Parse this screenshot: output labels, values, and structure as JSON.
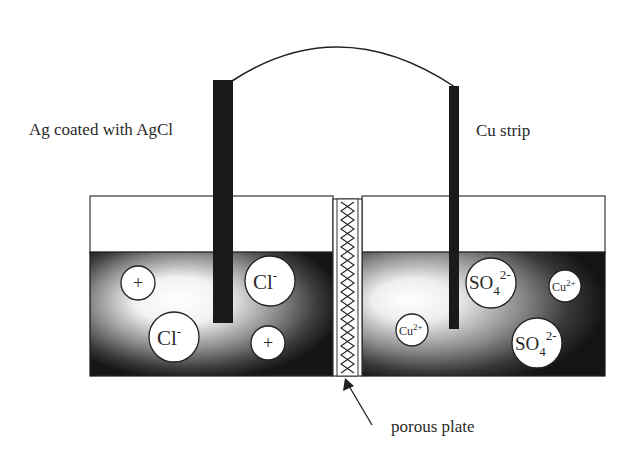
{
  "diagram": {
    "type": "electrochemical-cell",
    "labels": {
      "left_electrode": "Ag coated with AgCl",
      "right_electrode": "Cu strip",
      "separator": "porous plate"
    },
    "left_half_cell": {
      "electrode": "Ag/AgCl",
      "ions": [
        {
          "id": "plus-1",
          "symbol": "+",
          "sup": "",
          "sub": ""
        },
        {
          "id": "cl-1",
          "symbol": "Cl",
          "sup": "-",
          "sub": ""
        },
        {
          "id": "cl-2",
          "symbol": "Cl",
          "sup": "-",
          "sub": ""
        },
        {
          "id": "plus-2",
          "symbol": "+",
          "sup": "",
          "sub": ""
        }
      ]
    },
    "right_half_cell": {
      "electrode": "Cu",
      "ions": [
        {
          "id": "so4-1",
          "symbol": "SO",
          "sub": "4",
          "sup": "2-"
        },
        {
          "id": "cu-1",
          "symbol": "Cu",
          "sub": "",
          "sup": "2+"
        },
        {
          "id": "cu-2",
          "symbol": "Cu",
          "sub": "",
          "sup": "2+"
        },
        {
          "id": "so4-2",
          "symbol": "SO",
          "sub": "4",
          "sup": "2-"
        }
      ]
    },
    "colors": {
      "electrode": "#1a1a1a",
      "outline": "#333333",
      "solution_dark": "#111111",
      "solution_light": "#ffffff"
    }
  }
}
